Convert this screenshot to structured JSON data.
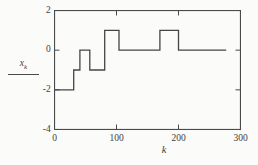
{
  "figure": {
    "background": "#fbfbf9",
    "frame_color": "#4a4a4a",
    "text_color": "#3d3d3d"
  },
  "chart_data": {
    "type": "line",
    "subtype": "step",
    "title": "",
    "xlabel": "k",
    "ylabel": "x_k",
    "ylabel_base": "x",
    "ylabel_sub": "k",
    "xlim": [
      0,
      300
    ],
    "ylim": [
      -4,
      2
    ],
    "x_ticks": [
      0,
      100,
      200,
      300
    ],
    "x_tick_labels": [
      "0",
      "100",
      "200",
      "300"
    ],
    "y_ticks": [
      2,
      0,
      -2,
      -4
    ],
    "y_tick_labels": [
      "2",
      "0",
      "-2",
      "-4"
    ],
    "grid": false,
    "legend_position": "none",
    "line_color": "#454545",
    "steps": [
      [
        0,
        -2
      ],
      [
        31,
        -1
      ],
      [
        41,
        0
      ],
      [
        57,
        -1
      ],
      [
        81,
        1
      ],
      [
        104,
        0
      ],
      [
        170,
        1
      ],
      [
        200,
        0
      ]
    ],
    "trace_end_x": 277
  }
}
